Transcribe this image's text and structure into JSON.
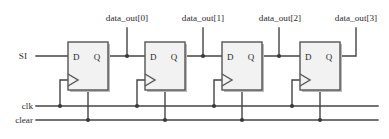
{
  "figure": {
    "background_color": "#ffffff",
    "wire_color": "#444444",
    "box_fill_color": "#f2f2f2",
    "box_stroke_color": "#555555",
    "text_color": "#2b2b2b"
  },
  "inputs": [
    {
      "id": "si",
      "label": "SI",
      "x": 27,
      "y": 59
    },
    {
      "id": "clk",
      "label": "clk",
      "x": 22,
      "y": 109
    },
    {
      "id": "clear",
      "label": "clear",
      "x": 13,
      "y": 123
    }
  ],
  "outputs": [
    {
      "id": "data_out_0",
      "label": "data_out[0]",
      "x": 101,
      "y": 18,
      "tap_x": 127
    },
    {
      "id": "data_out_1",
      "label": "data_out[1]",
      "x": 177,
      "y": 18,
      "tap_x": 203
    },
    {
      "id": "data_out_2",
      "label": "data_out[2]",
      "x": 253,
      "y": 18,
      "tap_x": 279
    },
    {
      "id": "data_out_3",
      "label": "data_out[3]",
      "x": 327,
      "y": 18,
      "tap_x": 356
    }
  ],
  "flipflops": [
    {
      "id": "ff0",
      "d_label": "D",
      "q_label": "Q",
      "x": 68,
      "y": 42,
      "w": 40,
      "h": 48
    },
    {
      "id": "ff1",
      "d_label": "D",
      "q_label": "Q",
      "x": 145,
      "y": 42,
      "w": 40,
      "h": 48
    },
    {
      "id": "ff2",
      "d_label": "D",
      "q_label": "Q",
      "x": 222,
      "y": 42,
      "w": 40,
      "h": 48
    },
    {
      "id": "ff3",
      "d_label": "D",
      "q_label": "Q",
      "x": 300,
      "y": 42,
      "w": 40,
      "h": 48
    }
  ],
  "buses": {
    "clk_y": 106,
    "clear_y": 120,
    "q_y": 56,
    "clk_junctions_x": [
      60,
      137,
      214,
      292
    ],
    "clear_junctions_x": [
      88,
      165,
      242,
      320
    ]
  }
}
